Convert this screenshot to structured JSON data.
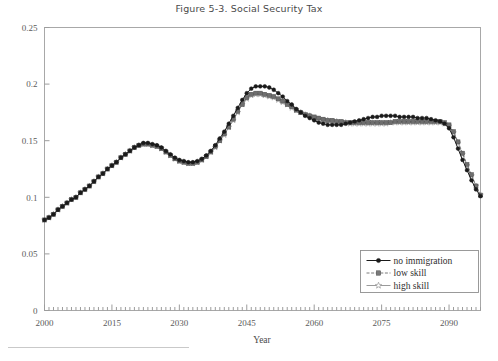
{
  "figure": {
    "title": "Figure 5-3. Social Security Tax"
  },
  "axes": {
    "x_title": "Year",
    "y_title": "",
    "x_ticks": [
      "2000",
      "2015",
      "2030",
      "2045",
      "2060",
      "2075",
      "2090"
    ],
    "y_ticks": [
      "0",
      "0.05",
      "0.1",
      "0.15",
      "0.2",
      "0.25"
    ]
  },
  "legend": {
    "entries": [
      {
        "label": "no immigration",
        "marker": "filled-circle",
        "dash": "solid",
        "color": "#1a1a1a"
      },
      {
        "label": "low skill",
        "marker": "filled-square",
        "dash": "dashed",
        "color": "#7a7a7a"
      },
      {
        "label": "high skill",
        "marker": "open-star",
        "dash": "solid",
        "color": "#9a9a9a"
      }
    ]
  },
  "footnote_rule": true,
  "chart_data": {
    "type": "line",
    "title": "Figure 5-3. Social Security Tax",
    "xlabel": "Year",
    "ylabel": "",
    "xlim": [
      2000,
      2097
    ],
    "ylim": [
      0,
      0.25
    ],
    "grid": false,
    "legend_position": "bottom-right",
    "x": [
      2000,
      2001,
      2002,
      2003,
      2004,
      2005,
      2006,
      2007,
      2008,
      2009,
      2010,
      2011,
      2012,
      2013,
      2014,
      2015,
      2016,
      2017,
      2018,
      2019,
      2020,
      2021,
      2022,
      2023,
      2024,
      2025,
      2026,
      2027,
      2028,
      2029,
      2030,
      2031,
      2032,
      2033,
      2034,
      2035,
      2036,
      2037,
      2038,
      2039,
      2040,
      2041,
      2042,
      2043,
      2044,
      2045,
      2046,
      2047,
      2048,
      2049,
      2050,
      2051,
      2052,
      2053,
      2054,
      2055,
      2056,
      2057,
      2058,
      2059,
      2060,
      2061,
      2062,
      2063,
      2064,
      2065,
      2066,
      2067,
      2068,
      2069,
      2070,
      2071,
      2072,
      2073,
      2074,
      2075,
      2076,
      2077,
      2078,
      2079,
      2080,
      2081,
      2082,
      2083,
      2084,
      2085,
      2086,
      2087,
      2088,
      2089,
      2090,
      2091,
      2092,
      2093,
      2094,
      2095,
      2096,
      2097
    ],
    "series": [
      {
        "name": "no immigration",
        "marker": "filled-circle",
        "dash": "solid",
        "color": "#1a1a1a",
        "values": [
          0.08,
          0.082,
          0.085,
          0.089,
          0.092,
          0.095,
          0.098,
          0.1,
          0.104,
          0.107,
          0.11,
          0.114,
          0.118,
          0.121,
          0.125,
          0.128,
          0.131,
          0.135,
          0.138,
          0.141,
          0.144,
          0.146,
          0.148,
          0.148,
          0.147,
          0.146,
          0.144,
          0.141,
          0.138,
          0.135,
          0.133,
          0.132,
          0.131,
          0.131,
          0.132,
          0.134,
          0.137,
          0.141,
          0.146,
          0.152,
          0.158,
          0.165,
          0.172,
          0.179,
          0.186,
          0.192,
          0.196,
          0.198,
          0.198,
          0.198,
          0.197,
          0.195,
          0.192,
          0.189,
          0.185,
          0.182,
          0.178,
          0.175,
          0.172,
          0.17,
          0.168,
          0.166,
          0.165,
          0.164,
          0.164,
          0.164,
          0.164,
          0.165,
          0.166,
          0.167,
          0.168,
          0.169,
          0.17,
          0.171,
          0.171,
          0.172,
          0.172,
          0.172,
          0.172,
          0.171,
          0.171,
          0.171,
          0.171,
          0.17,
          0.17,
          0.17,
          0.169,
          0.168,
          0.167,
          0.165,
          0.161,
          0.153,
          0.143,
          0.133,
          0.124,
          0.115,
          0.107,
          0.101
        ]
      },
      {
        "name": "low skill",
        "marker": "filled-square",
        "dash": "dashed",
        "color": "#6e6e6e",
        "values": [
          0.08,
          0.082,
          0.085,
          0.089,
          0.092,
          0.095,
          0.098,
          0.1,
          0.104,
          0.107,
          0.11,
          0.114,
          0.118,
          0.121,
          0.125,
          0.128,
          0.131,
          0.135,
          0.138,
          0.141,
          0.144,
          0.146,
          0.147,
          0.147,
          0.146,
          0.145,
          0.143,
          0.14,
          0.137,
          0.134,
          0.132,
          0.131,
          0.13,
          0.13,
          0.131,
          0.133,
          0.136,
          0.14,
          0.145,
          0.15,
          0.156,
          0.162,
          0.169,
          0.176,
          0.182,
          0.188,
          0.191,
          0.192,
          0.192,
          0.191,
          0.19,
          0.189,
          0.187,
          0.185,
          0.182,
          0.18,
          0.177,
          0.175,
          0.173,
          0.172,
          0.171,
          0.17,
          0.169,
          0.168,
          0.168,
          0.167,
          0.167,
          0.166,
          0.166,
          0.166,
          0.166,
          0.166,
          0.166,
          0.166,
          0.166,
          0.166,
          0.166,
          0.166,
          0.167,
          0.167,
          0.167,
          0.167,
          0.167,
          0.167,
          0.167,
          0.167,
          0.167,
          0.167,
          0.167,
          0.166,
          0.164,
          0.158,
          0.149,
          0.139,
          0.129,
          0.12,
          0.11,
          0.102
        ]
      },
      {
        "name": "high skill",
        "marker": "open-star",
        "dash": "solid",
        "color": "#9e9e9e",
        "values": [
          0.08,
          0.082,
          0.085,
          0.089,
          0.092,
          0.095,
          0.098,
          0.1,
          0.104,
          0.107,
          0.11,
          0.114,
          0.118,
          0.121,
          0.125,
          0.128,
          0.131,
          0.135,
          0.138,
          0.141,
          0.144,
          0.146,
          0.147,
          0.147,
          0.146,
          0.145,
          0.143,
          0.14,
          0.137,
          0.134,
          0.132,
          0.131,
          0.13,
          0.13,
          0.131,
          0.133,
          0.136,
          0.14,
          0.144,
          0.15,
          0.155,
          0.162,
          0.168,
          0.175,
          0.182,
          0.187,
          0.19,
          0.191,
          0.191,
          0.19,
          0.189,
          0.188,
          0.186,
          0.184,
          0.182,
          0.179,
          0.177,
          0.175,
          0.173,
          0.172,
          0.17,
          0.169,
          0.168,
          0.168,
          0.167,
          0.167,
          0.166,
          0.166,
          0.165,
          0.165,
          0.165,
          0.165,
          0.165,
          0.165,
          0.165,
          0.165,
          0.165,
          0.166,
          0.166,
          0.166,
          0.166,
          0.166,
          0.166,
          0.166,
          0.166,
          0.166,
          0.166,
          0.166,
          0.166,
          0.165,
          0.163,
          0.157,
          0.148,
          0.138,
          0.128,
          0.119,
          0.11,
          0.102
        ]
      }
    ]
  }
}
